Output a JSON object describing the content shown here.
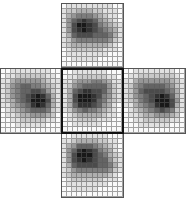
{
  "diagram": {
    "layout": "cross",
    "cols": 12,
    "rows": 13,
    "patches": [
      {
        "id": "top",
        "x": 61,
        "y": 3,
        "w": 63,
        "h": 65,
        "highlighted": false,
        "grid": [
          [
            0,
            1,
            1,
            1,
            1,
            1,
            1,
            1,
            1,
            1,
            0,
            0
          ],
          [
            1,
            2,
            2,
            3,
            3,
            3,
            2,
            2,
            1,
            1,
            1,
            0
          ],
          [
            1,
            3,
            4,
            5,
            5,
            5,
            4,
            3,
            2,
            1,
            1,
            0
          ],
          [
            1,
            4,
            6,
            7,
            8,
            7,
            6,
            4,
            3,
            2,
            1,
            0
          ],
          [
            1,
            4,
            7,
            9,
            9,
            8,
            7,
            5,
            4,
            3,
            2,
            1
          ],
          [
            1,
            4,
            7,
            8,
            9,
            8,
            7,
            6,
            5,
            4,
            3,
            1
          ],
          [
            1,
            3,
            6,
            7,
            7,
            7,
            6,
            6,
            6,
            5,
            3,
            1
          ],
          [
            1,
            2,
            4,
            5,
            5,
            5,
            5,
            5,
            5,
            4,
            2,
            1
          ],
          [
            1,
            2,
            3,
            3,
            3,
            3,
            3,
            3,
            3,
            2,
            1,
            0
          ],
          [
            0,
            1,
            2,
            2,
            2,
            2,
            2,
            2,
            1,
            1,
            1,
            0
          ],
          [
            0,
            1,
            1,
            1,
            1,
            1,
            1,
            1,
            1,
            0,
            0,
            0
          ],
          [
            0,
            0,
            1,
            1,
            1,
            1,
            1,
            0,
            0,
            0,
            0,
            0
          ],
          [
            0,
            0,
            0,
            0,
            0,
            0,
            0,
            0,
            0,
            0,
            0,
            0
          ]
        ]
      },
      {
        "id": "left",
        "x": 0,
        "y": 68,
        "w": 62,
        "h": 66,
        "highlighted": false,
        "grid": [
          [
            0,
            0,
            1,
            1,
            1,
            1,
            1,
            1,
            1,
            1,
            0,
            0
          ],
          [
            0,
            1,
            1,
            2,
            2,
            2,
            2,
            2,
            2,
            1,
            1,
            0
          ],
          [
            1,
            1,
            3,
            4,
            4,
            4,
            4,
            4,
            3,
            2,
            1,
            1
          ],
          [
            1,
            2,
            4,
            5,
            6,
            6,
            5,
            5,
            4,
            3,
            2,
            1
          ],
          [
            1,
            2,
            4,
            5,
            6,
            6,
            7,
            7,
            6,
            4,
            2,
            1
          ],
          [
            1,
            2,
            4,
            5,
            6,
            7,
            8,
            9,
            8,
            6,
            3,
            1
          ],
          [
            1,
            2,
            3,
            5,
            6,
            7,
            9,
            9,
            9,
            7,
            3,
            1
          ],
          [
            1,
            1,
            3,
            4,
            5,
            6,
            8,
            9,
            8,
            6,
            3,
            1
          ],
          [
            0,
            1,
            2,
            3,
            4,
            5,
            6,
            6,
            6,
            5,
            2,
            1
          ],
          [
            0,
            1,
            1,
            2,
            3,
            3,
            4,
            4,
            4,
            3,
            2,
            0
          ],
          [
            0,
            0,
            1,
            1,
            2,
            2,
            2,
            2,
            2,
            1,
            1,
            0
          ],
          [
            0,
            0,
            0,
            1,
            1,
            1,
            1,
            1,
            1,
            0,
            0,
            0
          ],
          [
            0,
            0,
            0,
            0,
            0,
            0,
            0,
            0,
            0,
            0,
            0,
            0
          ]
        ]
      },
      {
        "id": "center",
        "x": 61,
        "y": 68,
        "w": 63,
        "h": 66,
        "highlighted": true,
        "grid": [
          [
            0,
            0,
            1,
            1,
            1,
            1,
            1,
            1,
            1,
            0,
            0,
            0
          ],
          [
            0,
            1,
            1,
            2,
            2,
            2,
            2,
            2,
            2,
            1,
            1,
            0
          ],
          [
            1,
            1,
            3,
            4,
            4,
            4,
            5,
            5,
            4,
            3,
            1,
            1
          ],
          [
            1,
            2,
            4,
            5,
            6,
            6,
            6,
            6,
            6,
            4,
            2,
            1
          ],
          [
            1,
            3,
            6,
            7,
            8,
            8,
            7,
            7,
            6,
            4,
            2,
            1
          ],
          [
            1,
            3,
            7,
            9,
            9,
            9,
            8,
            7,
            5,
            4,
            2,
            1
          ],
          [
            1,
            3,
            7,
            9,
            9,
            9,
            8,
            6,
            5,
            3,
            2,
            1
          ],
          [
            1,
            3,
            6,
            8,
            8,
            8,
            7,
            6,
            4,
            3,
            1,
            0
          ],
          [
            1,
            2,
            4,
            5,
            6,
            5,
            5,
            4,
            3,
            2,
            1,
            0
          ],
          [
            0,
            1,
            2,
            3,
            3,
            3,
            3,
            3,
            2,
            1,
            1,
            0
          ],
          [
            0,
            1,
            1,
            2,
            2,
            2,
            2,
            1,
            1,
            1,
            0,
            0
          ],
          [
            0,
            0,
            1,
            1,
            1,
            1,
            1,
            1,
            0,
            0,
            0,
            0
          ],
          [
            0,
            0,
            0,
            0,
            0,
            0,
            0,
            0,
            0,
            0,
            0,
            0
          ]
        ]
      },
      {
        "id": "right",
        "x": 123,
        "y": 68,
        "w": 63,
        "h": 66,
        "highlighted": false,
        "grid": [
          [
            0,
            0,
            1,
            1,
            1,
            1,
            1,
            1,
            1,
            1,
            0,
            0
          ],
          [
            0,
            1,
            1,
            2,
            2,
            2,
            2,
            2,
            2,
            2,
            1,
            0
          ],
          [
            1,
            1,
            3,
            4,
            4,
            4,
            4,
            4,
            4,
            3,
            2,
            1
          ],
          [
            1,
            2,
            4,
            5,
            6,
            6,
            6,
            6,
            5,
            4,
            2,
            1
          ],
          [
            1,
            2,
            4,
            6,
            7,
            7,
            7,
            7,
            6,
            5,
            3,
            1
          ],
          [
            1,
            2,
            4,
            5,
            6,
            7,
            8,
            9,
            8,
            6,
            3,
            1
          ],
          [
            1,
            2,
            3,
            5,
            6,
            7,
            9,
            9,
            9,
            7,
            4,
            1
          ],
          [
            1,
            1,
            3,
            4,
            5,
            6,
            8,
            9,
            9,
            7,
            3,
            1
          ],
          [
            0,
            1,
            2,
            3,
            4,
            5,
            6,
            7,
            6,
            5,
            2,
            1
          ],
          [
            0,
            1,
            1,
            2,
            3,
            3,
            4,
            4,
            4,
            3,
            2,
            0
          ],
          [
            0,
            0,
            1,
            1,
            2,
            2,
            2,
            2,
            2,
            1,
            1,
            0
          ],
          [
            0,
            0,
            0,
            1,
            1,
            1,
            1,
            1,
            1,
            0,
            0,
            0
          ],
          [
            0,
            0,
            0,
            0,
            0,
            0,
            0,
            0,
            0,
            0,
            0,
            0
          ]
        ]
      },
      {
        "id": "bottom",
        "x": 61,
        "y": 133,
        "w": 63,
        "h": 65,
        "highlighted": false,
        "grid": [
          [
            0,
            0,
            1,
            1,
            1,
            1,
            1,
            1,
            1,
            0,
            0,
            0
          ],
          [
            1,
            1,
            2,
            3,
            3,
            3,
            3,
            2,
            2,
            1,
            1,
            0
          ],
          [
            1,
            3,
            4,
            6,
            6,
            6,
            5,
            4,
            3,
            2,
            1,
            0
          ],
          [
            1,
            4,
            6,
            8,
            9,
            8,
            7,
            5,
            4,
            3,
            1,
            0
          ],
          [
            1,
            4,
            7,
            9,
            9,
            9,
            7,
            6,
            5,
            3,
            2,
            1
          ],
          [
            1,
            4,
            7,
            8,
            9,
            8,
            7,
            6,
            6,
            4,
            2,
            1
          ],
          [
            1,
            3,
            6,
            7,
            7,
            7,
            7,
            6,
            6,
            5,
            3,
            1
          ],
          [
            1,
            2,
            4,
            5,
            5,
            5,
            5,
            5,
            5,
            4,
            2,
            1
          ],
          [
            1,
            2,
            3,
            3,
            3,
            3,
            3,
            3,
            3,
            2,
            1,
            0
          ],
          [
            0,
            1,
            2,
            2,
            2,
            2,
            2,
            2,
            1,
            1,
            1,
            0
          ],
          [
            0,
            1,
            1,
            1,
            1,
            1,
            1,
            1,
            1,
            0,
            0,
            0
          ],
          [
            0,
            0,
            1,
            1,
            1,
            1,
            1,
            0,
            0,
            0,
            0,
            0
          ],
          [
            0,
            0,
            0,
            0,
            0,
            0,
            0,
            0,
            0,
            0,
            0,
            0
          ]
        ]
      }
    ]
  }
}
